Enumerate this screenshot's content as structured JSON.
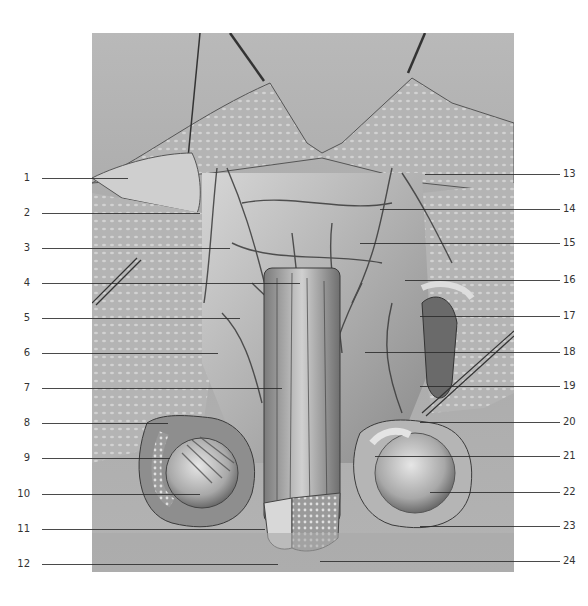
{
  "figure": {
    "type": "anatomical-illustration",
    "palette": {
      "background": "#ffffff",
      "panel": "#b0b0b0",
      "tissue_light": "#d9d9d9",
      "tissue_dark": "#3c3c3c",
      "leader_line": "#2a2a2a",
      "label_text": "#333333"
    },
    "left_labels": [
      {
        "num": "1",
        "y": 178,
        "target_x": 128
      },
      {
        "num": "2",
        "y": 213,
        "target_x": 200
      },
      {
        "num": "3",
        "y": 248,
        "target_x": 230
      },
      {
        "num": "4",
        "y": 283,
        "target_x": 300
      },
      {
        "num": "5",
        "y": 318,
        "target_x": 240
      },
      {
        "num": "6",
        "y": 353,
        "target_x": 218
      },
      {
        "num": "7",
        "y": 388,
        "target_x": 282
      },
      {
        "num": "8",
        "y": 423,
        "target_x": 168
      },
      {
        "num": "9",
        "y": 458,
        "target_x": 170
      },
      {
        "num": "10",
        "y": 494,
        "target_x": 200
      },
      {
        "num": "11",
        "y": 529,
        "target_x": 265
      },
      {
        "num": "12",
        "y": 564,
        "target_x": 278
      }
    ],
    "right_labels": [
      {
        "num": "13",
        "y": 174,
        "target_x": 425
      },
      {
        "num": "14",
        "y": 209,
        "target_x": 380
      },
      {
        "num": "15",
        "y": 243,
        "target_x": 360
      },
      {
        "num": "16",
        "y": 280,
        "target_x": 405
      },
      {
        "num": "17",
        "y": 316,
        "target_x": 420
      },
      {
        "num": "18",
        "y": 352,
        "target_x": 365
      },
      {
        "num": "19",
        "y": 386,
        "target_x": 420
      },
      {
        "num": "20",
        "y": 422,
        "target_x": 420
      },
      {
        "num": "21",
        "y": 456,
        "target_x": 375
      },
      {
        "num": "22",
        "y": 492,
        "target_x": 430
      },
      {
        "num": "23",
        "y": 526,
        "target_x": 420
      },
      {
        "num": "24",
        "y": 561,
        "target_x": 320
      }
    ]
  }
}
